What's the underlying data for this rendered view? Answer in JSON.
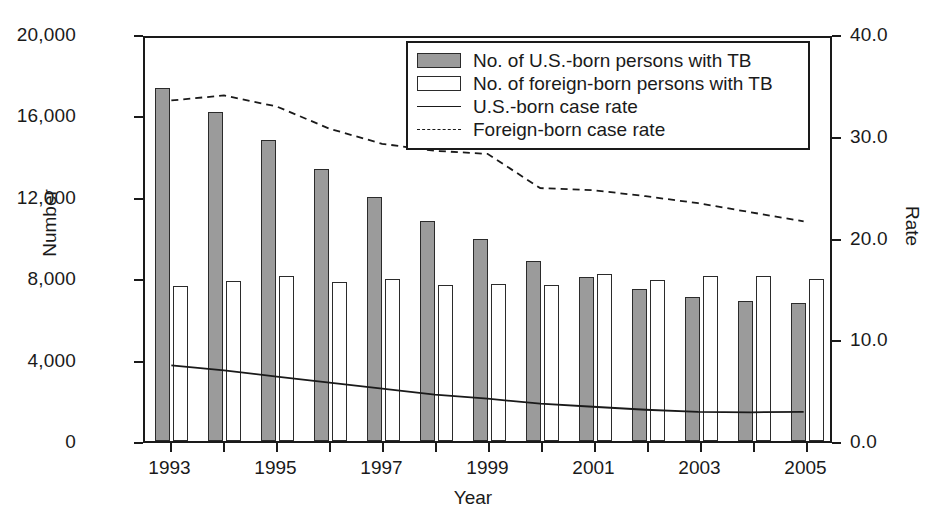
{
  "chart_data": {
    "type": "bar",
    "title": "",
    "xlabel": "Year",
    "ylabel": "Number",
    "y2label": "Rate",
    "grid": false,
    "legend_position": "top-center-right",
    "categories": [
      1993,
      1994,
      1995,
      1996,
      1997,
      1998,
      1999,
      2000,
      2001,
      2002,
      2003,
      2004,
      2005
    ],
    "xtick_labels": [
      "1993",
      "",
      "1995",
      "",
      "1997",
      "",
      "1999",
      "",
      "2001",
      "",
      "2003",
      "",
      "2005"
    ],
    "ylim": [
      0,
      20000
    ],
    "ytick_labels": [
      "0",
      "4,000",
      "8,000",
      "12,000",
      "16,000",
      "20,000"
    ],
    "ytick_values": [
      0,
      4000,
      8000,
      12000,
      16000,
      20000
    ],
    "y2lim": [
      0,
      40.0
    ],
    "y2tick_labels": [
      "0.0",
      "10.0",
      "20.0",
      "30.0",
      "40.0"
    ],
    "y2tick_values": [
      0,
      10,
      20,
      30,
      40
    ],
    "series": [
      {
        "name": "No. of U.S.-born persons with TB",
        "kind": "bar",
        "axis": "left",
        "fill": "#9b9b9b",
        "values": [
          17350,
          16150,
          14800,
          13350,
          12000,
          10800,
          9950,
          8850,
          8050,
          7450,
          7100,
          6900,
          6800
        ]
      },
      {
        "name": "No. of foreign-born persons with TB",
        "kind": "bar",
        "axis": "left",
        "fill": "#ffffff",
        "values": [
          7600,
          7850,
          8100,
          7800,
          7950,
          7650,
          7700,
          7650,
          8200,
          7900,
          8100,
          8100,
          7950
        ]
      },
      {
        "name": "U.S.-born case rate",
        "kind": "line",
        "axis": "right",
        "style": "solid",
        "values": [
          7.5,
          7.0,
          6.4,
          5.8,
          5.2,
          4.6,
          4.2,
          3.7,
          3.4,
          3.1,
          2.9,
          2.85,
          2.9
        ]
      },
      {
        "name": "Foreign-born case rate",
        "kind": "line",
        "axis": "right",
        "style": "dashed",
        "values": [
          33.8,
          34.3,
          33.2,
          31.0,
          29.5,
          28.8,
          28.5,
          25.1,
          24.9,
          24.3,
          23.6,
          22.7,
          21.8
        ]
      }
    ]
  },
  "legend": {
    "items": [
      {
        "label": "No. of U.S.-born persons with TB",
        "swatch": "filled-gray-rect"
      },
      {
        "label": "No. of foreign-born persons with TB",
        "swatch": "empty-white-rect"
      },
      {
        "label": "U.S.-born case rate",
        "swatch": "solid-line"
      },
      {
        "label": "Foreign-born case rate",
        "swatch": "dashed-line"
      }
    ]
  },
  "colors": {
    "us_born_bar": "#9b9b9b",
    "foreign_born_bar": "#ffffff",
    "axis": "#1a1a1a",
    "background": "#ffffff"
  }
}
